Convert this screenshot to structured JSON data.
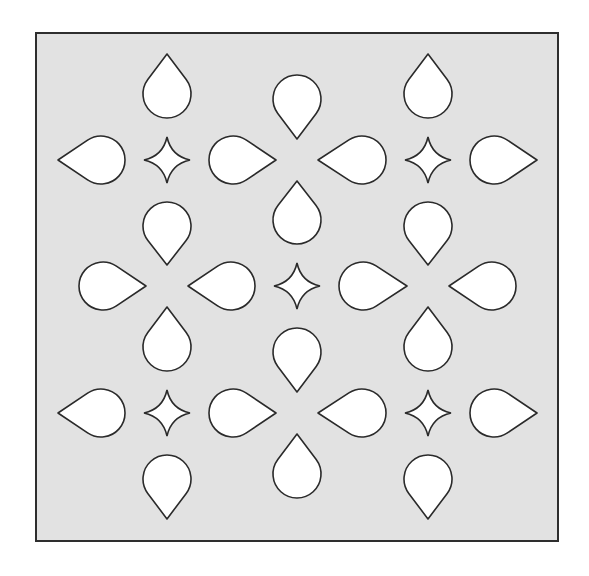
{
  "figure": {
    "title": "",
    "colors": {
      "page_background": "#ffffff",
      "panel_fill": "#e2e2e2",
      "panel_border": "#2e2e2e",
      "shape_fill": "#ffffff",
      "shape_stroke": "#2a2a2a"
    },
    "panel": {
      "x": 36,
      "y": 33,
      "width": 522,
      "height": 508,
      "border_width": 2
    },
    "lattice": {
      "columns": [
        37,
        167,
        297,
        428,
        558
      ],
      "rows": [
        33,
        160,
        286,
        413,
        540
      ]
    },
    "stars": [
      {
        "x": 167,
        "y": 160
      },
      {
        "x": 428,
        "y": 160
      },
      {
        "x": 297,
        "y": 286
      },
      {
        "x": 167,
        "y": 413
      },
      {
        "x": 428,
        "y": 413
      }
    ],
    "star_radius": 23,
    "teardrop": {
      "radius": 24,
      "gap_from_star": 42,
      "gap_from_tip_node": 21
    },
    "counts": {
      "stars": 5,
      "teardrops": 28
    }
  }
}
